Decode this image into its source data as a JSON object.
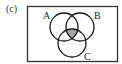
{
  "panel_label": "(c)",
  "venn": {
    "sets": [
      {
        "name": "A",
        "label": "A"
      },
      {
        "name": "B",
        "label": "B"
      },
      {
        "name": "C",
        "label": "C"
      }
    ],
    "shaded_region": "A ∩ B ∩ C",
    "colors": {
      "outline": "#1a1a1a",
      "shade": "#a8a8a8",
      "background": "#ffffff"
    }
  }
}
